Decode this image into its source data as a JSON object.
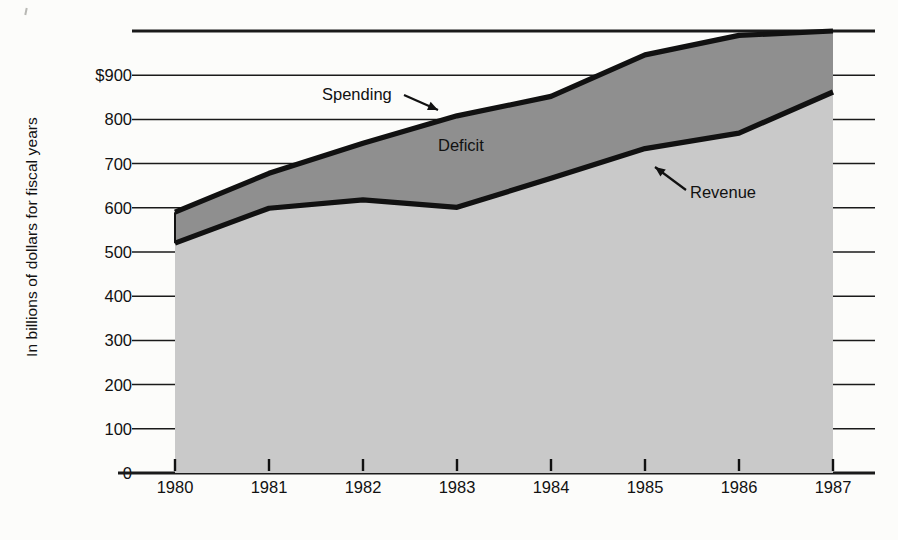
{
  "chart_data": {
    "type": "area",
    "title": "",
    "subtitle": "",
    "xlabel": "",
    "ylabel": "In billions of dollars for fiscal years",
    "categories": [
      "1980",
      "1981",
      "1982",
      "1983",
      "1984",
      "1985",
      "1986",
      "1987"
    ],
    "x": [
      1980,
      1981,
      1982,
      1983,
      1984,
      1985,
      1986,
      1987
    ],
    "xlim": [
      1980,
      1987
    ],
    "ylim": [
      0,
      1000
    ],
    "yticks": [
      0,
      100,
      200,
      300,
      400,
      500,
      600,
      700,
      800,
      900
    ],
    "ytick_labels": [
      "0",
      "100",
      "200",
      "300",
      "400",
      "500",
      "600",
      "700",
      "800",
      "$900"
    ],
    "grid": true,
    "legend_position": "inline-annotations",
    "series": [
      {
        "name": "Spending",
        "values": [
          590,
          678,
          746,
          808,
          852,
          946,
          990,
          1000
        ],
        "label": "Spending",
        "fill_color": "#8f8f8f",
        "line_color": "#111111"
      },
      {
        "name": "Revenue",
        "values": [
          520,
          599,
          618,
          601,
          667,
          734,
          769,
          862
        ],
        "label": "Revenue",
        "fill_color": "#c9c9c9",
        "line_color": "#111111"
      }
    ],
    "annotations": [
      {
        "text": "Spending",
        "target_series": "Spending",
        "arrow": "down-right"
      },
      {
        "text": "Deficit",
        "target_series": "between-spending-and-revenue",
        "arrow": "none"
      },
      {
        "text": "Revenue",
        "target_series": "Revenue",
        "arrow": "up-left"
      }
    ],
    "colors": {
      "deficit_band": "#8f8f8f",
      "revenue_band": "#c9c9c9",
      "line": "#111111",
      "gridline": "#1a1a1a",
      "background": "#fcfcfa"
    }
  }
}
